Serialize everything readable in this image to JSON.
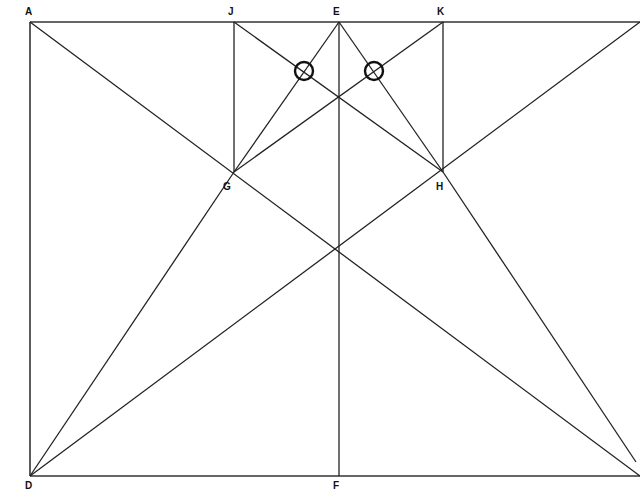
{
  "points": {
    "A": {
      "label": "A"
    },
    "J": {
      "label": "J"
    },
    "E": {
      "label": "E"
    },
    "K": {
      "label": "K"
    },
    "G": {
      "label": "G"
    },
    "H": {
      "label": "H"
    },
    "D": {
      "label": "D"
    },
    "F": {
      "label": "F"
    }
  },
  "segments": [
    [
      "A",
      "TR"
    ],
    [
      "A",
      "D"
    ],
    [
      "D",
      "BR"
    ],
    [
      "A",
      "BR"
    ],
    [
      "D",
      "TR"
    ],
    [
      "J",
      "G"
    ],
    [
      "K",
      "H"
    ],
    [
      "E",
      "F"
    ],
    [
      "E",
      "G"
    ],
    [
      "E",
      "H"
    ],
    [
      "J",
      "H"
    ],
    [
      "K",
      "G"
    ],
    [
      "G",
      "D"
    ],
    [
      "H",
      "BR2"
    ]
  ],
  "markers": [
    {
      "type": "circle",
      "near": "left intersection of E-G and J-H"
    },
    {
      "type": "circle",
      "near": "right intersection of E-H and K-G"
    }
  ]
}
